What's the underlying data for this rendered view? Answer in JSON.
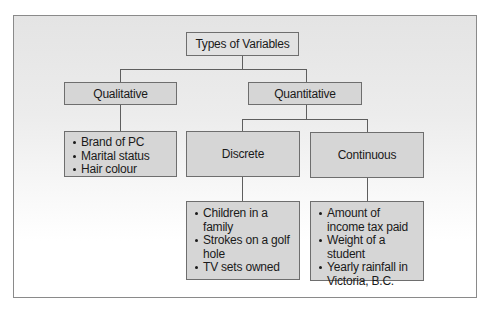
{
  "diagram": {
    "title": "Types of Variables",
    "branches": {
      "qualitative": {
        "label": "Qualitative",
        "examples": [
          "Brand of PC",
          "Marital status",
          "Hair colour"
        ]
      },
      "quantitative": {
        "label": "Quantitative",
        "discrete": {
          "label": "Discrete",
          "examples": [
            "Children in a family",
            "Strokes on a golf hole",
            "TV sets owned"
          ]
        },
        "continuous": {
          "label": "Continuous",
          "examples": [
            "Amount of income tax paid",
            "Weight of a student",
            "Yearly rainfall in Victoria, B.C."
          ]
        }
      }
    }
  },
  "colors": {
    "box_fill": "#d6d6d6",
    "box_border": "#6e6e6e",
    "connector": "#5e5e5e",
    "frame_border": "#8a8a8a"
  }
}
